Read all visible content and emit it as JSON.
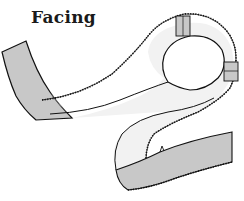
{
  "diagram": {
    "title": "Facing",
    "colors": {
      "background": "#ffffff",
      "facing_face": "#f2f2f2",
      "facing_reverse": "#c8c8c8",
      "outline": "#111111"
    },
    "parts": [
      {
        "name": "left-strip-end",
        "shade": "reverse"
      },
      {
        "name": "upper-loop-band",
        "shade": "face"
      },
      {
        "name": "round-neck-opening",
        "shade": "background"
      },
      {
        "name": "top-seam-patch",
        "shade": "reverse"
      },
      {
        "name": "right-seam-patch",
        "shade": "reverse"
      },
      {
        "name": "lower-curve-band",
        "shade": "face"
      },
      {
        "name": "right-strip-end",
        "shade": "reverse"
      }
    ]
  }
}
